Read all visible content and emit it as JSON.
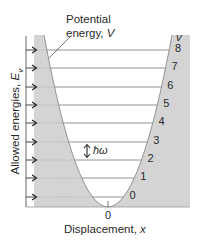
{
  "diagram": {
    "potential_label": {
      "line1": "Potential",
      "line2_text": "energy, ",
      "line2_symbol": "V"
    },
    "quantum_number_header": "v",
    "y_axis_label": {
      "text": "Allowed energies, ",
      "symbol": "E",
      "subscript": "v"
    },
    "x_axis_label": {
      "text": "Displacement, ",
      "symbol": "x"
    },
    "x_origin_label": "0",
    "spacing_label": "ħω",
    "levels": [
      {
        "v": "8",
        "y": 50
      },
      {
        "v": "7",
        "y": 68
      },
      {
        "v": "6",
        "y": 87
      },
      {
        "v": "5",
        "y": 105
      },
      {
        "v": "4",
        "y": 123
      },
      {
        "v": "3",
        "y": 142
      },
      {
        "v": "2",
        "y": 160
      },
      {
        "v": "1",
        "y": 178
      },
      {
        "v": "0",
        "y": 197
      }
    ],
    "colors": {
      "shade": "#d4d4d4",
      "line": "#7a7a7a",
      "text": "#2a2a2a",
      "arrow": "#333333"
    }
  }
}
